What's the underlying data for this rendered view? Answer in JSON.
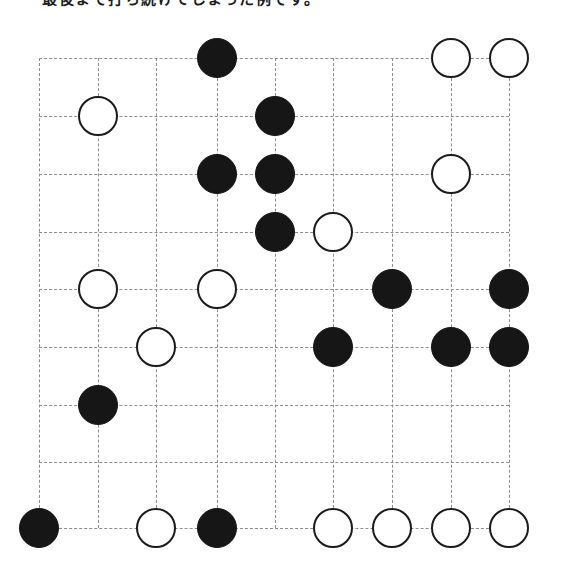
{
  "caption": {
    "text": "最後まで打ち続けてしまった例です。",
    "visible_fragment": "最後…を打ち続…てしまった…"
  },
  "board": {
    "type": "go-board-diagram",
    "columns": 9,
    "rows": 9,
    "grid_x": [
      39,
      98,
      156,
      217,
      275,
      333,
      392,
      451,
      509
    ],
    "grid_y": [
      58,
      116,
      174,
      232,
      289,
      347,
      405,
      462,
      528
    ],
    "stone_diameter": 40,
    "colors": {
      "black_stone": "#161616",
      "white_stone_fill": "#ffffff",
      "white_stone_edge": "#1b1b1b",
      "gridline": "#8d8d8d",
      "background": "#ffffff"
    },
    "stones": [
      {
        "color": "black",
        "col": 4,
        "row": 1
      },
      {
        "color": "white",
        "col": 8,
        "row": 1
      },
      {
        "color": "white",
        "col": 9,
        "row": 1
      },
      {
        "color": "white",
        "col": 2,
        "row": 2
      },
      {
        "color": "black",
        "col": 5,
        "row": 2
      },
      {
        "color": "black",
        "col": 4,
        "row": 3
      },
      {
        "color": "black",
        "col": 5,
        "row": 3
      },
      {
        "color": "white",
        "col": 8,
        "row": 3
      },
      {
        "color": "black",
        "col": 5,
        "row": 4
      },
      {
        "color": "white",
        "col": 6,
        "row": 4
      },
      {
        "color": "white",
        "col": 2,
        "row": 5
      },
      {
        "color": "white",
        "col": 4,
        "row": 5
      },
      {
        "color": "black",
        "col": 7,
        "row": 5
      },
      {
        "color": "black",
        "col": 9,
        "row": 5
      },
      {
        "color": "white",
        "col": 3,
        "row": 6
      },
      {
        "color": "black",
        "col": 6,
        "row": 6
      },
      {
        "color": "black",
        "col": 8,
        "row": 6
      },
      {
        "color": "black",
        "col": 9,
        "row": 6
      },
      {
        "color": "black",
        "col": 2,
        "row": 7
      },
      {
        "color": "black",
        "col": 1,
        "row": 9
      },
      {
        "color": "white",
        "col": 3,
        "row": 9
      },
      {
        "color": "black",
        "col": 4,
        "row": 9
      },
      {
        "color": "white",
        "col": 6,
        "row": 9
      },
      {
        "color": "white",
        "col": 7,
        "row": 9
      },
      {
        "color": "white",
        "col": 8,
        "row": 9
      },
      {
        "color": "white",
        "col": 9,
        "row": 9
      }
    ],
    "counts": {
      "black": 13,
      "white": 13,
      "total": 26
    }
  }
}
